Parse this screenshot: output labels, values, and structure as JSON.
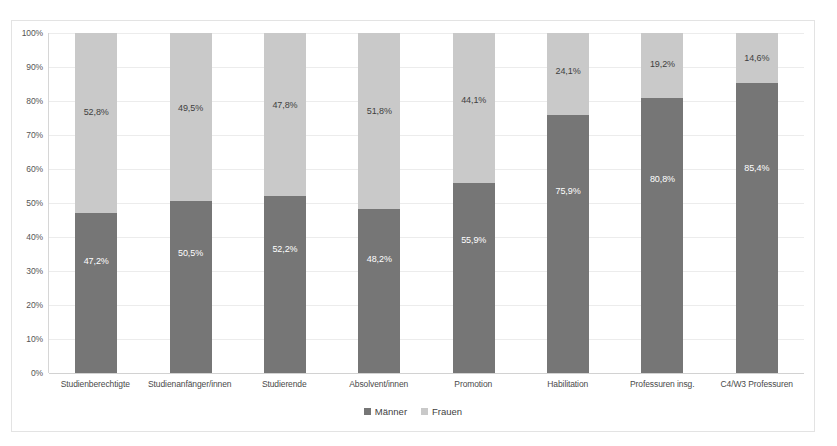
{
  "chart_data": {
    "type": "bar",
    "subtype": "stacked-100-percent",
    "title": "",
    "subtitle": "",
    "xlabel": "",
    "ylabel": "",
    "ylim": [
      0,
      100
    ],
    "ytick_labels": [
      "100%",
      "90%",
      "80%",
      "70%",
      "60%",
      "50%",
      "40%",
      "30%",
      "20%",
      "10%",
      "0%"
    ],
    "ytick_values": [
      100,
      90,
      80,
      70,
      60,
      50,
      40,
      30,
      20,
      10,
      0
    ],
    "grid": true,
    "legend_position": "bottom",
    "categories": [
      "Studienberechtigte",
      "Studienanfänger/innen",
      "Studierende",
      "Absolvent/innen",
      "Promotion",
      "Habilitation",
      "Professuren insg.",
      "C4/W3 Professuren"
    ],
    "series": [
      {
        "name": "Männer",
        "color": "#767676",
        "values": [
          47.2,
          50.5,
          52.2,
          48.2,
          55.9,
          75.9,
          80.8,
          85.4
        ],
        "labels": [
          "47,2%",
          "50,5%",
          "52,2%",
          "48,2%",
          "55,9%",
          "75,9%",
          "80,8%",
          "85,4%"
        ]
      },
      {
        "name": "Frauen",
        "color": "#c9c9c9",
        "values": [
          52.8,
          49.5,
          47.8,
          51.8,
          44.1,
          24.1,
          19.2,
          14.6
        ],
        "labels": [
          "52,8%",
          "49,5%",
          "47,8%",
          "51,8%",
          "44,1%",
          "24,1%",
          "19,2%",
          "14,6%"
        ]
      }
    ]
  },
  "legend": {
    "items": [
      {
        "label": "Männer",
        "color": "#767676"
      },
      {
        "label": "Frauen",
        "color": "#c9c9c9"
      }
    ]
  },
  "colors": {
    "maenner": "#767676",
    "frauen": "#c9c9c9",
    "gridline": "#ececec",
    "frame": "#e3e3e3",
    "background": "#ffffff"
  }
}
